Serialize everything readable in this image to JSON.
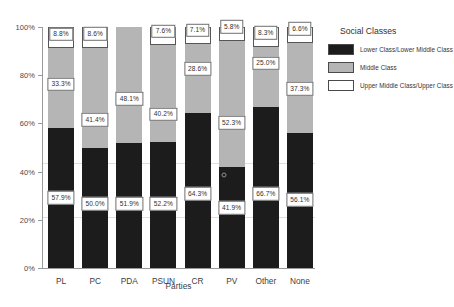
{
  "chart_data": {
    "type": "bar",
    "stacked": true,
    "stack_mode": "percent",
    "title": "",
    "xlabel": "Parties",
    "ylabel": "",
    "ylim": [
      0,
      100
    ],
    "yticks": [
      "0%",
      "20%",
      "40%",
      "60%",
      "80%",
      "100%"
    ],
    "ytick_values": [
      0,
      20,
      40,
      60,
      80,
      100
    ],
    "grid": false,
    "legend_title": "Social Classes",
    "legend_position": "right",
    "categories": [
      "PL",
      "PC",
      "PDA",
      "PSUN",
      "CR",
      "PV",
      "Other",
      "None"
    ],
    "series": [
      {
        "name": "Lower Class/Lower Middle Class",
        "color": "#1c1c1c",
        "values": [
          57.9,
          50.0,
          51.9,
          52.2,
          64.3,
          41.9,
          66.7,
          56.1
        ],
        "labels": [
          "57.9%",
          "50.0%",
          "51.9%",
          "52.2%",
          "64.3%",
          "41.9%",
          "66.7%",
          "56.1%"
        ]
      },
      {
        "name": "Middle Class",
        "color": "#b5b5b5",
        "values": [
          33.3,
          41.4,
          48.1,
          40.2,
          28.6,
          52.3,
          25.0,
          37.3
        ],
        "labels": [
          "33.3%",
          "41.4%",
          "48.1%",
          "40.2%",
          "28.6%",
          "52.3%",
          "25.0%",
          "37.3%"
        ]
      },
      {
        "name": "Upper Middle Class/Upper Class",
        "color": "#ffffff",
        "values": [
          8.8,
          8.6,
          0.0,
          7.6,
          7.1,
          5.8,
          8.3,
          6.6
        ],
        "labels": [
          "8.8%",
          "8.6%",
          "",
          "7.6%",
          "7.1%",
          "5.8%",
          "8.3%",
          "6.6%"
        ]
      }
    ]
  },
  "axis": {
    "x_title": "Parties"
  },
  "legend": {
    "title": "Social Classes",
    "items": [
      {
        "label": "Lower Class/Lower Middle Class",
        "color": "#1c1c1c"
      },
      {
        "label": "Middle Class",
        "color": "#b5b5b5"
      },
      {
        "label": "Upper Middle Class/Upper Class",
        "color": "#ffffff"
      }
    ]
  }
}
